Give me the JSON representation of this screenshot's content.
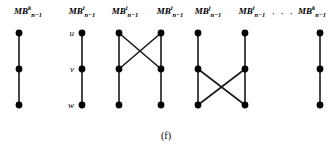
{
  "figure": {
    "caption": "(f)",
    "caption_x": 166,
    "caption_y": 130,
    "width": 331,
    "height": 149,
    "vertex_color": "#000000",
    "edge_color": "#1a1a1a",
    "background": "#ffffff",
    "vertex_radius": 3.4,
    "edge_width": 1.6,
    "rows": [
      {
        "name": "u",
        "label": "u",
        "y": 33,
        "label_x": 74
      },
      {
        "name": "v",
        "label": "v",
        "y": 69,
        "label_x": 74
      },
      {
        "name": "w",
        "label": "w",
        "y": 105,
        "label_x": 74
      }
    ],
    "columns": [
      {
        "id": "c1",
        "x": 19,
        "label_base": "MB",
        "label_sup": "k",
        "label_sub": "n−1",
        "label_x": 28,
        "label_y": 7
      },
      {
        "id": "c2",
        "x": 82,
        "label_base": "MB",
        "label_sup": "i",
        "label_sub": "n−1",
        "label_x": 82,
        "label_y": 7
      },
      {
        "id": "c3",
        "x": 119,
        "label_base": "MB",
        "label_sup": "i",
        "label_sub": "n−1",
        "label_x": 125,
        "label_y": 7
      },
      {
        "id": "c4",
        "x": 161,
        "label_base": "MB",
        "label_sup": "i",
        "label_sub": "n−1",
        "label_x": 170,
        "label_y": 7
      },
      {
        "id": "c5",
        "x": 198,
        "label_base": "MB",
        "label_sup": "j",
        "label_sub": "n−1",
        "label_x": 208,
        "label_y": 7
      },
      {
        "id": "c6",
        "x": 245,
        "label_base": "MB",
        "label_sup": "i",
        "label_sub": "n−1",
        "label_x": 252,
        "label_y": 7
      },
      {
        "id": "c7",
        "x": 320,
        "label_base": "MB",
        "label_sup": "k",
        "label_sub": "n−1",
        "label_x": 312,
        "label_y": 7
      }
    ],
    "ellipsis": {
      "text": "·  ·  ·",
      "x": 283,
      "y": 8
    },
    "vertices": [
      {
        "id": "v1u",
        "col": 0,
        "row": 0,
        "x": 19,
        "y": 33
      },
      {
        "id": "v1v",
        "col": 0,
        "row": 1,
        "x": 19,
        "y": 69
      },
      {
        "id": "v1w",
        "col": 0,
        "row": 2,
        "x": 19,
        "y": 105
      },
      {
        "id": "v2u",
        "col": 1,
        "row": 0,
        "x": 82,
        "y": 33
      },
      {
        "id": "v2v",
        "col": 1,
        "row": 1,
        "x": 82,
        "y": 69
      },
      {
        "id": "v2w",
        "col": 1,
        "row": 2,
        "x": 82,
        "y": 105
      },
      {
        "id": "v3u",
        "col": 2,
        "row": 0,
        "x": 119,
        "y": 33
      },
      {
        "id": "v3v",
        "col": 2,
        "row": 1,
        "x": 119,
        "y": 69
      },
      {
        "id": "v3w",
        "col": 2,
        "row": 2,
        "x": 119,
        "y": 105
      },
      {
        "id": "v4u",
        "col": 3,
        "row": 0,
        "x": 161,
        "y": 33
      },
      {
        "id": "v4v",
        "col": 3,
        "row": 1,
        "x": 161,
        "y": 69
      },
      {
        "id": "v4w",
        "col": 3,
        "row": 2,
        "x": 161,
        "y": 105
      },
      {
        "id": "v5u",
        "col": 4,
        "row": 0,
        "x": 198,
        "y": 33
      },
      {
        "id": "v5v",
        "col": 4,
        "row": 1,
        "x": 198,
        "y": 69
      },
      {
        "id": "v5w",
        "col": 4,
        "row": 2,
        "x": 198,
        "y": 105
      },
      {
        "id": "v6u",
        "col": 5,
        "row": 0,
        "x": 245,
        "y": 33
      },
      {
        "id": "v6v",
        "col": 5,
        "row": 1,
        "x": 245,
        "y": 69
      },
      {
        "id": "v6w",
        "col": 5,
        "row": 2,
        "x": 245,
        "y": 105
      },
      {
        "id": "v7u",
        "col": 6,
        "row": 0,
        "x": 320,
        "y": 33
      },
      {
        "id": "v7v",
        "col": 6,
        "row": 1,
        "x": 320,
        "y": 69
      },
      {
        "id": "v7w",
        "col": 6,
        "row": 2,
        "x": 320,
        "y": 105
      }
    ],
    "edges": [
      {
        "id": "e1",
        "from": "v1u",
        "to": "v1v",
        "x1": 19,
        "y1": 33,
        "x2": 19,
        "y2": 69
      },
      {
        "id": "e2",
        "from": "v1v",
        "to": "v1w",
        "x1": 19,
        "y1": 69,
        "x2": 19,
        "y2": 105
      },
      {
        "id": "e3",
        "from": "v2u",
        "to": "v2v",
        "x1": 82,
        "y1": 33,
        "x2": 82,
        "y2": 69
      },
      {
        "id": "e4",
        "from": "v2v",
        "to": "v2w",
        "x1": 82,
        "y1": 69,
        "x2": 82,
        "y2": 105
      },
      {
        "id": "e5",
        "from": "v3u",
        "to": "v3v",
        "x1": 119,
        "y1": 33,
        "x2": 119,
        "y2": 69
      },
      {
        "id": "e6",
        "from": "v3v",
        "to": "v3w",
        "x1": 119,
        "y1": 69,
        "x2": 119,
        "y2": 105
      },
      {
        "id": "e7",
        "from": "v4u",
        "to": "v4v",
        "x1": 161,
        "y1": 33,
        "x2": 161,
        "y2": 69
      },
      {
        "id": "e8",
        "from": "v4v",
        "to": "v4w",
        "x1": 161,
        "y1": 69,
        "x2": 161,
        "y2": 105
      },
      {
        "id": "e9",
        "from": "v3u",
        "to": "v4v",
        "x1": 119,
        "y1": 33,
        "x2": 161,
        "y2": 69
      },
      {
        "id": "e10",
        "from": "v4u",
        "to": "v3v",
        "x1": 161,
        "y1": 33,
        "x2": 119,
        "y2": 69
      },
      {
        "id": "e11",
        "from": "v5u",
        "to": "v5v",
        "x1": 198,
        "y1": 33,
        "x2": 198,
        "y2": 69
      },
      {
        "id": "e12",
        "from": "v5v",
        "to": "v5w",
        "x1": 198,
        "y1": 69,
        "x2": 198,
        "y2": 105
      },
      {
        "id": "e13",
        "from": "v6u",
        "to": "v6v",
        "x1": 245,
        "y1": 33,
        "x2": 245,
        "y2": 69
      },
      {
        "id": "e14",
        "from": "v6v",
        "to": "v6w",
        "x1": 245,
        "y1": 69,
        "x2": 245,
        "y2": 105
      },
      {
        "id": "e15",
        "from": "v5v",
        "to": "v6w",
        "x1": 198,
        "y1": 69,
        "x2": 245,
        "y2": 105
      },
      {
        "id": "e16",
        "from": "v6v",
        "to": "v5w",
        "x1": 245,
        "y1": 69,
        "x2": 198,
        "y2": 105
      },
      {
        "id": "e17",
        "from": "v7u",
        "to": "v7v",
        "x1": 320,
        "y1": 33,
        "x2": 320,
        "y2": 69
      },
      {
        "id": "e18",
        "from": "v7v",
        "to": "v7w",
        "x1": 320,
        "y1": 69,
        "x2": 320,
        "y2": 105
      }
    ]
  }
}
